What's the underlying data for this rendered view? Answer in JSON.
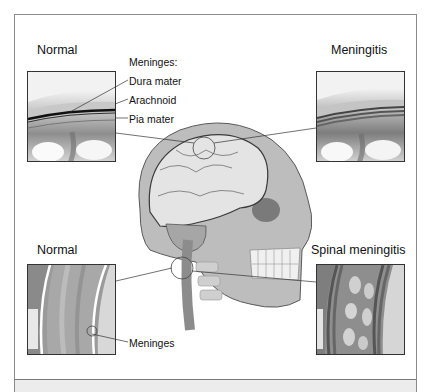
{
  "figure": {
    "panels": {
      "top_left": {
        "title": "Normal",
        "view": "brain meninges cross-section"
      },
      "top_right": {
        "title": "Meningitis",
        "view": "inflamed brain meninges cross-section"
      },
      "bottom_left": {
        "title": "Normal",
        "view": "spinal cord meninges"
      },
      "bottom_right": {
        "title": "Spinal meningitis",
        "view": "inflamed spinal cord meninges"
      }
    },
    "labels": {
      "meninges_header": "Meninges:",
      "dura": "Dura mater",
      "arachnoid": "Arachnoid",
      "pia": "Pia mater",
      "meninges": "Meninges"
    },
    "center": {
      "view": "sagittal head with brain, skull and spinal cord"
    },
    "colors": {
      "frame": "#8a8a8a",
      "strip": "#ececec",
      "ink": "#111111"
    }
  }
}
